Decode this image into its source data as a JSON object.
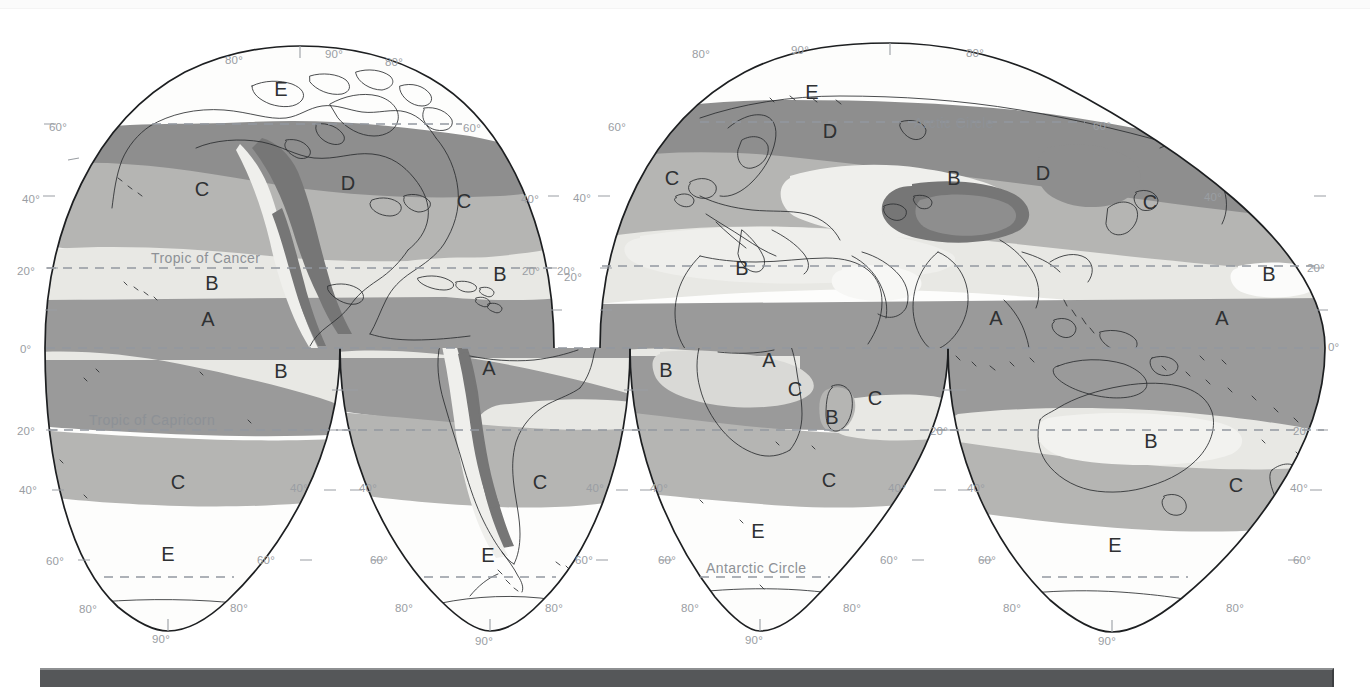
{
  "document": {
    "kind": "world-climate-zone-map",
    "projection_style": "interrupted equal-area (Goode homolosine) lobes"
  },
  "map": {
    "title": "",
    "climate_zone_letters": [
      "A",
      "B",
      "C",
      "D",
      "E"
    ],
    "reference_lines": [
      {
        "name": "arctic-circle",
        "label": "Arctic Circle"
      },
      {
        "name": "tropic-of-cancer",
        "label": "Tropic of Cancer"
      },
      {
        "name": "equator",
        "label": ""
      },
      {
        "name": "tropic-of-capricorn",
        "label": "Tropic of Capricorn"
      },
      {
        "name": "antarctic-circle",
        "label": "Antarctic Circle"
      }
    ],
    "latitude_labels": [
      "80°",
      "60°",
      "40°",
      "20°",
      "0°",
      "20°",
      "40°",
      "60°",
      "80°"
    ],
    "pole_labels": [
      "90°"
    ],
    "degree_values": {
      "d0": "0°",
      "d20": "20°",
      "d40": "40°",
      "d60": "60°",
      "d80": "80°",
      "d90": "90°"
    },
    "colors": {
      "zone_a": "#9a9a9a",
      "zone_b": "#e8e8e4",
      "zone_c": "#b5b5b3",
      "zone_d": "#8e8e8e",
      "zone_e": "#fdfdfc",
      "highland": "#767676",
      "outline": "#1d1f21",
      "graticule": "#9a9ea3",
      "dash_line": "#9298a0",
      "bottom_bar": "#555759"
    },
    "zone_label_placements": [
      {
        "lobe": 1,
        "letter": "E",
        "x": 281,
        "y": 96
      },
      {
        "lobe": 1,
        "letter": "C",
        "x": 202,
        "y": 196
      },
      {
        "lobe": 1,
        "letter": "D",
        "x": 348,
        "y": 190
      },
      {
        "lobe": 1,
        "letter": "C",
        "x": 464,
        "y": 208
      },
      {
        "lobe": 1,
        "letter": "B",
        "x": 212,
        "y": 290
      },
      {
        "lobe": 1,
        "letter": "B",
        "x": 500,
        "y": 281
      },
      {
        "lobe": 1,
        "letter": "A",
        "x": 208,
        "y": 326
      },
      {
        "lobe": 2,
        "letter": "B",
        "x": 281,
        "y": 378
      },
      {
        "lobe": 2,
        "letter": "A",
        "x": 489,
        "y": 375
      },
      {
        "lobe": 2,
        "letter": "C",
        "x": 178,
        "y": 489
      },
      {
        "lobe": 2,
        "letter": "C",
        "x": 540,
        "y": 489
      },
      {
        "lobe": 2,
        "letter": "E",
        "x": 168,
        "y": 561
      },
      {
        "lobe": 2,
        "letter": "E",
        "x": 488,
        "y": 562
      },
      {
        "lobe": 3,
        "letter": "E",
        "x": 812,
        "y": 99
      },
      {
        "lobe": 3,
        "letter": "D",
        "x": 830,
        "y": 138
      },
      {
        "lobe": 3,
        "letter": "C",
        "x": 672,
        "y": 185
      },
      {
        "lobe": 3,
        "letter": "B",
        "x": 954,
        "y": 185
      },
      {
        "lobe": 3,
        "letter": "D",
        "x": 1043,
        "y": 180
      },
      {
        "lobe": 3,
        "letter": "C",
        "x": 1150,
        "y": 209
      },
      {
        "lobe": 3,
        "letter": "B",
        "x": 742,
        "y": 275
      },
      {
        "lobe": 3,
        "letter": "B",
        "x": 1269,
        "y": 281
      },
      {
        "lobe": 3,
        "letter": "A",
        "x": 996,
        "y": 325
      },
      {
        "lobe": 3,
        "letter": "A",
        "x": 1222,
        "y": 325
      },
      {
        "lobe": 4,
        "letter": "A",
        "x": 769,
        "y": 367
      },
      {
        "lobe": 4,
        "letter": "B",
        "x": 666,
        "y": 377
      },
      {
        "lobe": 4,
        "letter": "C",
        "x": 795,
        "y": 396
      },
      {
        "lobe": 4,
        "letter": "C",
        "x": 875,
        "y": 405
      },
      {
        "lobe": 4,
        "letter": "B",
        "x": 832,
        "y": 424
      },
      {
        "lobe": 4,
        "letter": "B",
        "x": 1151,
        "y": 448
      },
      {
        "lobe": 4,
        "letter": "C",
        "x": 829,
        "y": 487
      },
      {
        "lobe": 4,
        "letter": "C",
        "x": 1236,
        "y": 492
      },
      {
        "lobe": 4,
        "letter": "E",
        "x": 758,
        "y": 538
      },
      {
        "lobe": 4,
        "letter": "E",
        "x": 1115,
        "y": 552
      }
    ]
  }
}
